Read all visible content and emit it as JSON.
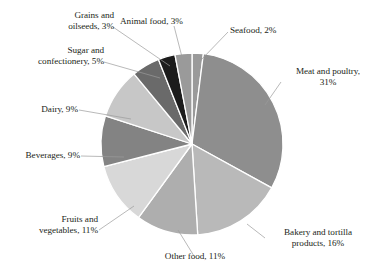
{
  "chart_data": {
    "type": "pie",
    "title": "",
    "subtitle": "",
    "xlabel": "",
    "ylabel": "",
    "legend_position": "none",
    "grid": false,
    "units": "percent",
    "start_angle_deg": 0,
    "direction": "clockwise",
    "categories": [
      "Seafood",
      "Meat and poultry",
      "Bakery and tortilla products",
      "Other food",
      "Fruits and vegetables",
      "Beverages",
      "Dairy",
      "Sugar and confectionery",
      "Grains and oilseeds",
      "Animal food"
    ],
    "values": [
      2,
      31,
      16,
      11,
      11,
      9,
      9,
      5,
      3,
      3
    ],
    "colors": [
      "#9a9a9a",
      "#8e8e8e",
      "#b9b9b9",
      "#aeaeae",
      "#d8d8d8",
      "#838383",
      "#c7c7c7",
      "#6a6a6a",
      "#1c1c1c",
      "#9a9a9a"
    ],
    "slice_separator_color": "#ffffff",
    "slices": [
      {
        "label": "Seafood, 2%",
        "name": "Seafood",
        "value": 2,
        "color": "#9a9a9a"
      },
      {
        "label": "Meat and poultry,\n31%",
        "name": "Meat and poultry",
        "value": 31,
        "color": "#8e8e8e"
      },
      {
        "label": "Bakery and tortilla\nproducts, 16%",
        "name": "Bakery and tortilla products",
        "value": 16,
        "color": "#b9b9b9"
      },
      {
        "label": "Other food, 11%",
        "name": "Other food",
        "value": 11,
        "color": "#aeaeae"
      },
      {
        "label": "Fruits and\nvegetables, 11%",
        "name": "Fruits and vegetables",
        "value": 11,
        "color": "#d8d8d8"
      },
      {
        "label": "Beverages, 9%",
        "name": "Beverages",
        "value": 9,
        "color": "#838383"
      },
      {
        "label": "Dairy, 9%",
        "name": "Dairy",
        "value": 9,
        "color": "#c7c7c7"
      },
      {
        "label": "Sugar and\nconfectionery, 5%",
        "name": "Sugar and confectionery",
        "value": 5,
        "color": "#6a6a6a"
      },
      {
        "label": "Grains and\noilseeds, 3%",
        "name": "Grains and oilseeds",
        "value": 3,
        "color": "#1c1c1c"
      },
      {
        "label": "Animal food, 3%",
        "name": "Animal food",
        "value": 3,
        "color": "#9a9a9a"
      }
    ]
  }
}
